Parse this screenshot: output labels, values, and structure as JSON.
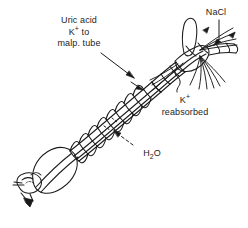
{
  "figure": {
    "title_visible": false,
    "type": "insect-gut-excretion-diagram",
    "background_color": "#ffffff",
    "line_color": "#1a1a1a"
  },
  "annotations": {
    "uric_acid": {
      "line1": "Uric acid",
      "line2_element": "K",
      "line2_charge": "+",
      "line2_rest": " to",
      "line3": "malp. tube",
      "leader": "solid-arrow"
    },
    "nacl": {
      "text": "NaCl",
      "leader": "solid-arrow"
    },
    "k_reabsorbed": {
      "line1_element": "K",
      "line1_charge": "+",
      "line2": "reabsorbed",
      "leader": "squiggle"
    },
    "water": {
      "element_h": "H",
      "count": "2",
      "element_o": "O",
      "leader": "dashed-arrow"
    }
  },
  "structures": {
    "head": "head-with-mouthparts",
    "crop": "crop-bulb",
    "midgut": "segmented-midgut",
    "hindgut": "hindgut",
    "rectum": "rectal-sac",
    "caecum": "gastric-caecum",
    "malpighian_tubules": "malpighian-tubules"
  }
}
